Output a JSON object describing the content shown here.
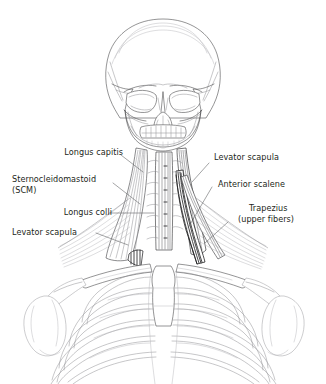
{
  "figure": {
    "view": "anterior",
    "background_color": "#ffffff",
    "line_color": "#231f20",
    "label_text_color": "#231f20",
    "leader_line_color": "#58595b",
    "muscle_shading_color": "#8c8c8c"
  },
  "labels": {
    "left": [
      {
        "id": "longus-capitis",
        "text": "Longus capitis"
      },
      {
        "id": "sternocleidomastoid",
        "text": "Sternocleidomastoid"
      },
      {
        "id": "scm-abbreviation",
        "text": "(SCM)"
      },
      {
        "id": "longus-colli",
        "text": "Longus colli"
      },
      {
        "id": "levator-scapula-left",
        "text": "Levator scapula"
      }
    ],
    "right": [
      {
        "id": "levator-scapula-right",
        "text": "Levator scapula"
      },
      {
        "id": "anterior-scalene",
        "text": "Anterior scalene"
      },
      {
        "id": "trapezius",
        "text": "Trapezius"
      },
      {
        "id": "trapezius-detail",
        "text": "(upper fibers)"
      }
    ]
  },
  "anatomy": {
    "skull": "cranium with orbits, nasal aperture, maxilla and mandible",
    "cervical_spine": "cervical vertebrae C1-C7",
    "thorax": "sternum with manubrium and seven rib pairs",
    "shoulders": "clavicles, scapulae and humeral heads"
  }
}
